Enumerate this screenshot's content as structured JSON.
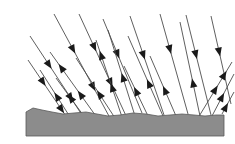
{
  "figure": {
    "title": "Diffuse reflection of incident rays from a rough ground surface",
    "type": "ray-diagram",
    "width": 235,
    "height": 144,
    "background_color": "#ffffff"
  },
  "colors": {
    "ray_stroke": "#4d4d4d",
    "arrow_fill": "#1a1a1a",
    "ground_fill": "#8c8c8c",
    "ground_stroke": "#595959",
    "background": "#ffffff"
  },
  "ground": {
    "label": "rough ground surface",
    "fill": "#8c8c8c",
    "stroke": "#595959",
    "top_profile": "M 26,112 L 33,108 L 42,110 L 52,112 L 63,114 L 74,113 L 86,112 L 97,114 L 108,116 L 120,115 L 133,113 L 146,114 L 158,116 L 170,115 L 182,114 L 194,115 L 205,116 L 216,115 L 224,115",
    "bottom_y": 136,
    "left_x": 26,
    "right_x": 224
  },
  "rays": {
    "incident_label": "incident ray",
    "reflected_label": "reflected ray",
    "incident": [
      {
        "name": "incident-ray-1",
        "x1": 54,
        "y1": 14,
        "x2": 110,
        "y2": 118,
        "arrows": [
          0.38,
          0.74
        ]
      },
      {
        "name": "incident-ray-2",
        "x1": 79,
        "y1": 14,
        "x2": 127,
        "y2": 118,
        "arrows": [
          0.36,
          0.7
        ]
      },
      {
        "name": "incident-ray-3",
        "x1": 103,
        "y1": 19,
        "x2": 142,
        "y2": 113,
        "arrows": [
          0.42
        ]
      },
      {
        "name": "incident-ray-4",
        "x1": 130,
        "y1": 16,
        "x2": 164,
        "y2": 115,
        "arrows": [
          0.44
        ]
      },
      {
        "name": "incident-ray-5",
        "x1": 160,
        "y1": 14,
        "x2": 188,
        "y2": 114,
        "arrows": [
          0.4
        ]
      },
      {
        "name": "incident-ray-6",
        "x1": 186,
        "y1": 15,
        "x2": 211,
        "y2": 115,
        "arrows": [
          0.44
        ]
      },
      {
        "name": "incident-ray-7",
        "x1": 211,
        "y1": 16,
        "x2": 231,
        "y2": 104,
        "arrows": [
          0.46
        ]
      },
      {
        "name": "incident-ray-8",
        "x1": 30,
        "y1": 36,
        "x2": 84,
        "y2": 118,
        "arrows": [
          0.4,
          0.8
        ]
      },
      {
        "name": "incident-ray-9",
        "x1": 28,
        "y1": 60,
        "x2": 70,
        "y2": 122,
        "arrows": [
          0.42,
          0.86
        ]
      }
    ],
    "reflected": [
      {
        "name": "reflected-ray-1",
        "x1": 98,
        "y1": 119,
        "x2": 50,
        "y2": 52,
        "arrows": [
          0.42,
          0.82
        ]
      },
      {
        "name": "reflected-ray-2",
        "x1": 115,
        "y1": 118,
        "x2": 76,
        "y2": 58,
        "arrows": [
          0.46
        ]
      },
      {
        "name": "reflected-ray-3",
        "x1": 122,
        "y1": 117,
        "x2": 96,
        "y2": 40,
        "arrows": [
          0.44,
          0.86
        ]
      },
      {
        "name": "reflected-ray-4",
        "x1": 135,
        "y1": 116,
        "x2": 108,
        "y2": 30,
        "arrows": [
          0.5
        ]
      },
      {
        "name": "reflected-ray-5",
        "x1": 163,
        "y1": 116,
        "x2": 128,
        "y2": 36,
        "arrows": [
          0.46
        ]
      },
      {
        "name": "reflected-ray-6",
        "x1": 176,
        "y1": 116,
        "x2": 150,
        "y2": 56,
        "arrows": [
          0.5
        ]
      },
      {
        "name": "reflected-ray-7",
        "x1": 200,
        "y1": 116,
        "x2": 180,
        "y2": 22,
        "arrows": [
          0.4
        ]
      },
      {
        "name": "reflected-ray-8",
        "x1": 198,
        "y1": 118,
        "x2": 232,
        "y2": 62,
        "arrows": [
          0.58,
          0.84
        ]
      },
      {
        "name": "reflected-ray-9",
        "x1": 212,
        "y1": 116,
        "x2": 234,
        "y2": 74,
        "arrows": [
          0.55
        ]
      },
      {
        "name": "reflected-ray-10",
        "x1": 222,
        "y1": 114,
        "x2": 234,
        "y2": 92,
        "arrows": [
          0.5
        ]
      },
      {
        "name": "reflected-ray-11",
        "x1": 86,
        "y1": 119,
        "x2": 56,
        "y2": 78,
        "arrows": [
          0.6
        ]
      },
      {
        "name": "reflected-ray-12",
        "x1": 72,
        "y1": 120,
        "x2": 40,
        "y2": 70,
        "arrows": [
          0.55
        ]
      },
      {
        "name": "reflected-ray-13",
        "x1": 148,
        "y1": 116,
        "x2": 124,
        "y2": 66,
        "arrows": [
          0.58
        ]
      }
    ]
  },
  "geometry": {
    "ray_stroke_width": 0.9,
    "arrow_length": 9,
    "arrow_half_width": 3.6
  }
}
